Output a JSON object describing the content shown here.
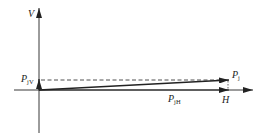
{
  "diagram": {
    "type": "vector-decomposition",
    "colors": {
      "stroke": "#222222",
      "background": "#ffffff"
    },
    "axes": {
      "vertical": {
        "label": "V"
      },
      "horizontal": {
        "label": "H"
      }
    },
    "vectors": [
      {
        "id": "Pj",
        "main": "P",
        "sub": "j",
        "description": "resultant vector"
      },
      {
        "id": "PjH",
        "main": "P",
        "sub": "jH",
        "description": "horizontal component"
      },
      {
        "id": "PjV",
        "main": "P",
        "sub": "jV",
        "description": "vertical component"
      }
    ],
    "labels": {
      "V": "V",
      "H": "H",
      "Pj_main": "P",
      "Pj_sub": "j",
      "PjH_main": "P",
      "PjH_sub": "jH",
      "PjV_main": "P",
      "PjV_sub": "jV"
    }
  }
}
